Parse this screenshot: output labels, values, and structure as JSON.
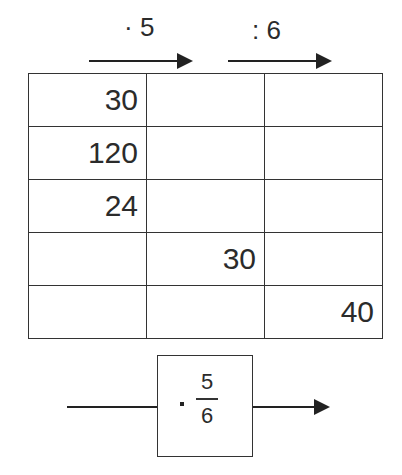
{
  "operators": {
    "first": "· 5",
    "second": ": 6"
  },
  "table": {
    "rows": [
      [
        "30",
        "",
        ""
      ],
      [
        "120",
        "",
        ""
      ],
      [
        "24",
        "",
        ""
      ],
      [
        "",
        "30",
        ""
      ],
      [
        "",
        "",
        "40"
      ]
    ]
  },
  "combined": {
    "operator": "·",
    "numerator": "5",
    "denominator": "6"
  }
}
